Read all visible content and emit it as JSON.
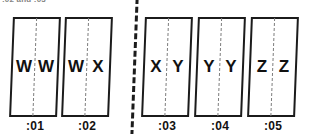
{
  "caption": {
    "text": ":02 and :03"
  },
  "divider": {
    "name": "group-separator",
    "style": "thick-dashed-vertical"
  },
  "colors": {
    "frame_border": "#1b1b1b",
    "center_dash": "#7d7d7d",
    "text": "#111111",
    "background": "#ffffff"
  },
  "timeline": {
    "groups": [
      {
        "name": "left-group",
        "frames": [
          {
            "left_letter": "W",
            "right_letter": "W",
            "tick": ":01"
          },
          {
            "left_letter": "W",
            "right_letter": "X",
            "tick": ":02"
          }
        ]
      },
      {
        "name": "right-group",
        "frames": [
          {
            "left_letter": "X",
            "right_letter": "Y",
            "tick": ":03"
          },
          {
            "left_letter": "Y",
            "right_letter": "Y",
            "tick": ":04"
          },
          {
            "left_letter": "Z",
            "right_letter": "Z",
            "tick": ":05"
          }
        ]
      }
    ],
    "frames_flat": [
      {
        "left_letter": "W",
        "right_letter": "W",
        "tick": ":01"
      },
      {
        "left_letter": "W",
        "right_letter": "X",
        "tick": ":02"
      },
      {
        "left_letter": "X",
        "right_letter": "Y",
        "tick": ":03"
      },
      {
        "left_letter": "Y",
        "right_letter": "Y",
        "tick": ":04"
      },
      {
        "left_letter": "Z",
        "right_letter": "Z",
        "tick": ":05"
      }
    ]
  }
}
